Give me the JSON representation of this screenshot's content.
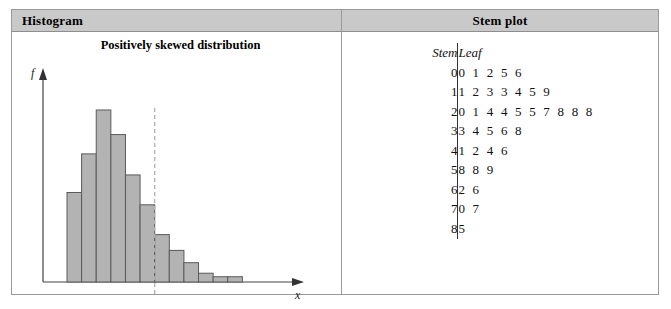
{
  "figure": {
    "panels": {
      "histogram": {
        "header": "Histogram",
        "chart_title": "Positively skewed distribution",
        "y_axis_label": "f",
        "x_axis_label": "x"
      },
      "stemplot": {
        "header": "Stem plot",
        "column_headers": {
          "stem": "Stem",
          "leaf": "Leaf"
        },
        "rows": [
          {
            "stem": "0",
            "leaf": "01256"
          },
          {
            "stem": "1",
            "leaf": "1233459"
          },
          {
            "stem": "2",
            "leaf": "0144557888"
          },
          {
            "stem": "3",
            "leaf": "34568"
          },
          {
            "stem": "4",
            "leaf": "1246"
          },
          {
            "stem": "5",
            "leaf": "889"
          },
          {
            "stem": "6",
            "leaf": "26"
          },
          {
            "stem": "7",
            "leaf": "07"
          },
          {
            "stem": "8",
            "leaf": "5"
          }
        ]
      }
    }
  },
  "colors": {
    "header_fill": "#c9c9c9",
    "bar_fill": "#b3b3b3",
    "bar_stroke": "#5a5a5a",
    "axis": "#444444",
    "median_line": "#b0b0b0",
    "frame": "#9a9a9a"
  },
  "chart_data": {
    "type": "bar",
    "title": "Positively skewed distribution",
    "xlabel": "x",
    "ylabel": "f",
    "grid": false,
    "legend": "none",
    "categories": [
      "1",
      "2",
      "3",
      "4",
      "5",
      "6",
      "7",
      "8",
      "9",
      "10",
      "11",
      "12",
      "13"
    ],
    "values": [
      51,
      73,
      98,
      84,
      61,
      44,
      27,
      18,
      11,
      5,
      3,
      3,
      0
    ],
    "ylim": [
      0,
      110
    ],
    "annotations": [
      {
        "type": "vertical-dashed-line",
        "at_category_index": 6,
        "label": ""
      }
    ]
  }
}
